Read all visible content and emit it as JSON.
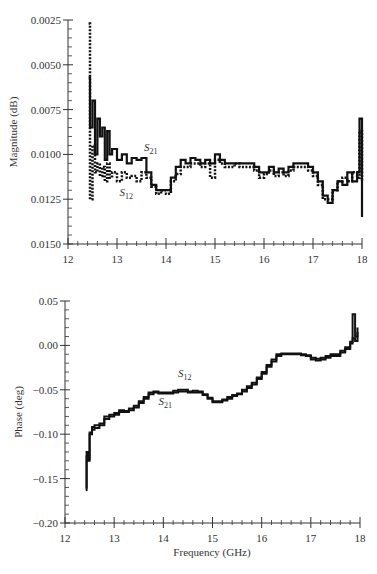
{
  "chart_data": [
    {
      "type": "line",
      "title": "",
      "xlabel": "",
      "ylabel": "Magnitude (dB)",
      "xlim": [
        12,
        18
      ],
      "ylim": [
        0.0025,
        0.015
      ],
      "x_ticks": [
        "12",
        "13",
        "14",
        "15",
        "16",
        "17",
        "18"
      ],
      "y_ticks": [
        "0.0025",
        "0.0050",
        "0.0075",
        "0.0100",
        "0.0125",
        "0.0150"
      ],
      "grid": false,
      "annotations": [
        {
          "text": "S",
          "sub": "21",
          "x": 13.55,
          "y": 0.0077
        },
        {
          "text": "S",
          "sub": "12",
          "x": 13.05,
          "y": 0.0052
        }
      ],
      "series": [
        {
          "name": "S21",
          "style": "solid",
          "x": [
            12.42,
            12.45,
            12.5,
            12.55,
            12.6,
            12.65,
            12.7,
            12.75,
            12.8,
            12.85,
            12.9,
            13.0,
            13.1,
            13.2,
            13.3,
            13.4,
            13.5,
            13.6,
            13.7,
            13.8,
            13.9,
            14.0,
            14.1,
            14.2,
            14.3,
            14.4,
            14.5,
            14.6,
            14.7,
            14.8,
            14.9,
            15.0,
            15.1,
            15.2,
            15.3,
            15.4,
            15.5,
            15.6,
            15.7,
            15.8,
            15.9,
            16.0,
            16.1,
            16.2,
            16.3,
            16.4,
            16.5,
            16.6,
            16.7,
            16.8,
            16.9,
            17.0,
            17.1,
            17.2,
            17.3,
            17.4,
            17.5,
            17.6,
            17.7,
            17.8,
            17.9,
            17.95,
            18.0
          ],
          "values": [
            0.0118,
            0.009,
            0.0105,
            0.0075,
            0.0095,
            0.0085,
            0.009,
            0.0072,
            0.0088,
            0.0075,
            0.0078,
            0.0072,
            0.0075,
            0.007,
            0.0073,
            0.0072,
            0.0073,
            0.0065,
            0.0058,
            0.0055,
            0.0055,
            0.0055,
            0.0062,
            0.0068,
            0.0072,
            0.007,
            0.0073,
            0.0072,
            0.007,
            0.0072,
            0.007,
            0.0075,
            0.0072,
            0.007,
            0.007,
            0.007,
            0.007,
            0.007,
            0.007,
            0.0068,
            0.0065,
            0.0065,
            0.0068,
            0.0065,
            0.0067,
            0.0065,
            0.0068,
            0.007,
            0.007,
            0.007,
            0.0068,
            0.0065,
            0.006,
            0.0052,
            0.0048,
            0.0055,
            0.006,
            0.0058,
            0.0065,
            0.006,
            0.0065,
            0.0095,
            0.004
          ]
        },
        {
          "name": "S12",
          "style": "dashed",
          "x": [
            12.42,
            12.45,
            12.5,
            12.55,
            12.6,
            12.65,
            12.7,
            12.75,
            12.8,
            12.85,
            12.9,
            13.0,
            13.1,
            13.2,
            13.3,
            13.4,
            13.5,
            13.6,
            13.7,
            13.8,
            13.9,
            14.0,
            14.1,
            14.2,
            14.3,
            14.4,
            14.5,
            14.6,
            14.7,
            14.8,
            14.9,
            15.0,
            15.1,
            15.2,
            15.3,
            15.4,
            15.5,
            15.6,
            15.7,
            15.8,
            15.9,
            16.0,
            16.1,
            16.2,
            16.3,
            16.4,
            16.5,
            16.6,
            16.7,
            16.8,
            16.9,
            17.0,
            17.1,
            17.2,
            17.3,
            17.4,
            17.5,
            17.6,
            17.7,
            17.8,
            17.9,
            17.95,
            18.0
          ],
          "values": [
            0.0148,
            0.005,
            0.008,
            0.0065,
            0.007,
            0.0063,
            0.0068,
            0.006,
            0.007,
            0.0062,
            0.0065,
            0.006,
            0.0065,
            0.0062,
            0.0063,
            0.006,
            0.0065,
            0.0062,
            0.0057,
            0.0053,
            0.0055,
            0.0053,
            0.006,
            0.0064,
            0.0068,
            0.0068,
            0.007,
            0.007,
            0.0068,
            0.007,
            0.0062,
            0.0072,
            0.007,
            0.0068,
            0.0068,
            0.007,
            0.0068,
            0.0068,
            0.0068,
            0.0066,
            0.0062,
            0.0064,
            0.0066,
            0.0063,
            0.0065,
            0.0063,
            0.0066,
            0.0068,
            0.0068,
            0.0068,
            0.0066,
            0.0063,
            0.0058,
            0.005,
            0.005,
            0.0055,
            0.006,
            0.0062,
            0.006,
            0.0065,
            0.0062,
            0.0088,
            0.006
          ]
        }
      ]
    },
    {
      "type": "line",
      "title": "",
      "xlabel": "Frequency (GHz)",
      "ylabel": "Phase (deg)",
      "xlim": [
        12,
        18
      ],
      "ylim": [
        -0.2,
        0.05
      ],
      "x_ticks": [
        "12",
        "13",
        "14",
        "15",
        "16",
        "17",
        "18"
      ],
      "y_ticks": [
        "0.05",
        "0.00",
        "−0.05",
        "−0.10",
        "−0.15",
        "−0.20"
      ],
      "grid": false,
      "annotations": [
        {
          "text": "S",
          "sub": "12",
          "x": 14.3,
          "y": -0.036
        },
        {
          "text": "S",
          "sub": "21",
          "x": 13.9,
          "y": -0.067
        }
      ],
      "series": [
        {
          "name": "S21",
          "style": "solid",
          "x": [
            12.42,
            12.44,
            12.46,
            12.5,
            12.55,
            12.6,
            12.7,
            12.8,
            12.9,
            13.0,
            13.1,
            13.2,
            13.3,
            13.4,
            13.5,
            13.6,
            13.7,
            13.8,
            13.9,
            14.0,
            14.1,
            14.2,
            14.3,
            14.4,
            14.5,
            14.6,
            14.7,
            14.8,
            14.9,
            15.0,
            15.1,
            15.2,
            15.3,
            15.4,
            15.5,
            15.6,
            15.7,
            15.8,
            15.9,
            16.0,
            16.1,
            16.2,
            16.3,
            16.4,
            16.5,
            16.6,
            16.7,
            16.8,
            16.9,
            17.0,
            17.1,
            17.2,
            17.3,
            17.4,
            17.5,
            17.6,
            17.7,
            17.8,
            17.85,
            17.9,
            17.95
          ],
          "values": [
            -0.163,
            -0.125,
            -0.13,
            -0.1,
            -0.095,
            -0.093,
            -0.09,
            -0.083,
            -0.08,
            -0.078,
            -0.075,
            -0.075,
            -0.073,
            -0.07,
            -0.065,
            -0.06,
            -0.055,
            -0.053,
            -0.054,
            -0.054,
            -0.054,
            -0.053,
            -0.052,
            -0.052,
            -0.053,
            -0.053,
            -0.053,
            -0.056,
            -0.06,
            -0.064,
            -0.064,
            -0.062,
            -0.06,
            -0.057,
            -0.055,
            -0.052,
            -0.048,
            -0.044,
            -0.038,
            -0.032,
            -0.024,
            -0.018,
            -0.012,
            -0.01,
            -0.01,
            -0.01,
            -0.01,
            -0.011,
            -0.012,
            -0.016,
            -0.017,
            -0.016,
            -0.014,
            -0.012,
            -0.012,
            -0.008,
            -0.004,
            0.002,
            0.008,
            0.005,
            0.015
          ]
        },
        {
          "name": "S12",
          "style": "solid",
          "x": [
            12.42,
            12.44,
            12.46,
            12.5,
            12.55,
            12.6,
            12.7,
            12.8,
            12.9,
            13.0,
            13.1,
            13.2,
            13.3,
            13.4,
            13.5,
            13.6,
            13.7,
            13.8,
            13.9,
            14.0,
            14.1,
            14.2,
            14.3,
            14.4,
            14.5,
            14.6,
            14.7,
            14.8,
            14.9,
            15.0,
            15.1,
            15.2,
            15.3,
            15.4,
            15.5,
            15.6,
            15.7,
            15.8,
            15.9,
            16.0,
            16.1,
            16.2,
            16.3,
            16.4,
            16.5,
            16.6,
            16.7,
            16.8,
            16.9,
            17.0,
            17.1,
            17.2,
            17.3,
            17.4,
            17.5,
            17.6,
            17.7,
            17.8,
            17.85,
            17.9,
            17.95
          ],
          "values": [
            -0.16,
            -0.12,
            -0.128,
            -0.098,
            -0.092,
            -0.09,
            -0.088,
            -0.08,
            -0.078,
            -0.076,
            -0.073,
            -0.074,
            -0.071,
            -0.068,
            -0.063,
            -0.058,
            -0.053,
            -0.052,
            -0.053,
            -0.053,
            -0.053,
            -0.051,
            -0.05,
            -0.05,
            -0.052,
            -0.051,
            -0.052,
            -0.055,
            -0.059,
            -0.063,
            -0.063,
            -0.061,
            -0.058,
            -0.056,
            -0.054,
            -0.05,
            -0.046,
            -0.042,
            -0.036,
            -0.03,
            -0.022,
            -0.016,
            -0.01,
            -0.009,
            -0.009,
            -0.009,
            -0.009,
            -0.01,
            -0.011,
            -0.014,
            -0.015,
            -0.014,
            -0.012,
            -0.01,
            -0.01,
            -0.006,
            -0.002,
            0.004,
            0.035,
            0.01,
            0.02
          ]
        }
      ]
    }
  ]
}
